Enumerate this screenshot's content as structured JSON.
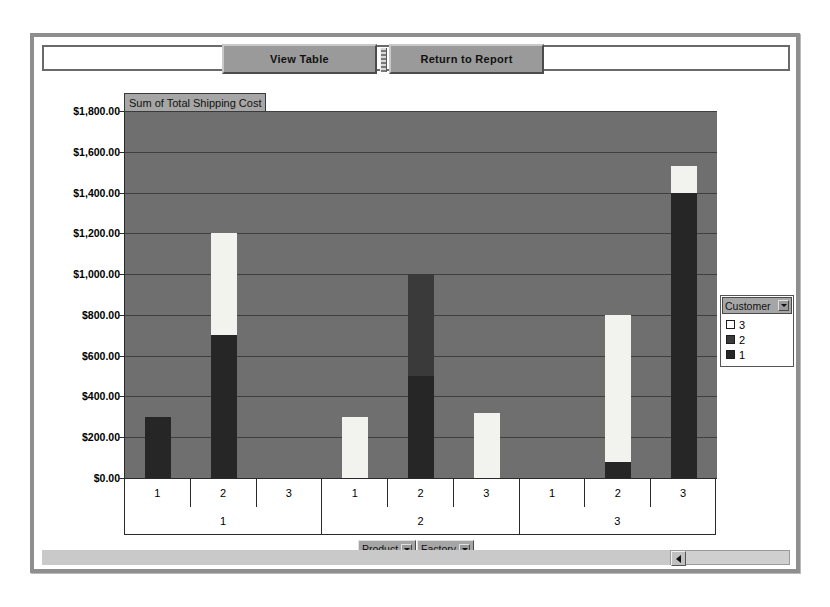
{
  "toolbar": {
    "view_table_label": "View Table",
    "return_label": "Return to Report"
  },
  "chart_title": "Sum of Total Shipping Cost",
  "legend": {
    "title": "Customer",
    "entries": [
      {
        "label": "3",
        "color": "#ffffff"
      },
      {
        "label": "2",
        "color": "#3a3a3a"
      },
      {
        "label": "1",
        "color": "#262626"
      }
    ]
  },
  "field_buttons": [
    {
      "label": "Product"
    },
    {
      "label": "Factory"
    }
  ],
  "chart_data": {
    "type": "bar",
    "stacked": true,
    "title": "Sum of Total Shipping Cost",
    "xlabel": "",
    "ylabel": "",
    "ylim": [
      0,
      1800
    ],
    "ytick_labels": [
      "$1,800.00",
      "$1,600.00",
      "$1,400.00",
      "$1,200.00",
      "$1,000.00",
      "$800.00",
      "$600.00",
      "$400.00",
      "$200.00",
      "$0.00"
    ],
    "ytick_values": [
      1800,
      1600,
      1400,
      1200,
      1000,
      800,
      600,
      400,
      200,
      0
    ],
    "grid": true,
    "legend_position": "right",
    "outer_categories": [
      "1",
      "2",
      "3"
    ],
    "outer_axis_name": "Factory",
    "inner_categories": [
      "1",
      "2",
      "3"
    ],
    "inner_axis_name": "Product",
    "series": [
      {
        "name": "1",
        "color": "#262626",
        "values": [
          300,
          700,
          0,
          0,
          500,
          0,
          0,
          80,
          1400
        ]
      },
      {
        "name": "2",
        "color": "#3a3a3a",
        "values": [
          0,
          0,
          0,
          0,
          500,
          0,
          0,
          0,
          0
        ]
      },
      {
        "name": "3",
        "color": "#ffffff",
        "values": [
          0,
          500,
          0,
          300,
          0,
          320,
          0,
          720,
          130
        ]
      }
    ],
    "group_totals": [
      300,
      1200,
      0,
      300,
      1000,
      320,
      0,
      800,
      1530
    ]
  }
}
